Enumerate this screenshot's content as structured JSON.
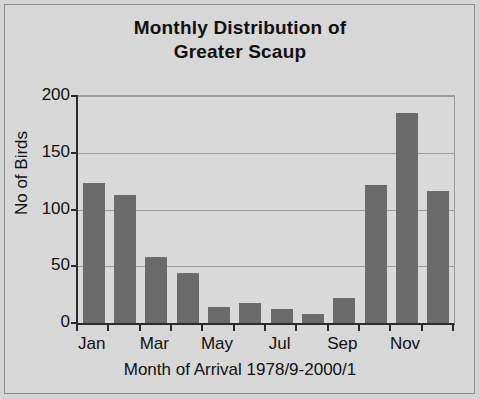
{
  "chart_data": {
    "type": "bar",
    "title": "Monthly Distribution of Greater Scaup",
    "title_line1": "Monthly Distribution of",
    "title_line2": "Greater Scaup",
    "categories": [
      "Jan",
      "Feb",
      "Mar",
      "Apr",
      "May",
      "Jun",
      "Jul",
      "Aug",
      "Sep",
      "Oct",
      "Nov",
      "Dec"
    ],
    "values": [
      123,
      113,
      58,
      44,
      14,
      18,
      12,
      8,
      22,
      122,
      185,
      116
    ],
    "xlabel": "Month of Arrival 1978/9-2000/1",
    "ylabel": "No of Birds",
    "ylim": [
      0,
      200
    ],
    "yticks": [
      0,
      50,
      100,
      150,
      200
    ],
    "ytick_labels": [
      "0",
      "50",
      "100",
      "150",
      "200"
    ],
    "visible_xtick_labels": [
      "Jan",
      "Mar",
      "May",
      "Jul",
      "Sep",
      "Nov"
    ],
    "grid": true,
    "legend": "none",
    "bar_color": "#6b6b6b",
    "plot_background": "#d9d9d9",
    "axis_color": "#2b2b2b",
    "gridline_color": "#9e9e9e"
  }
}
